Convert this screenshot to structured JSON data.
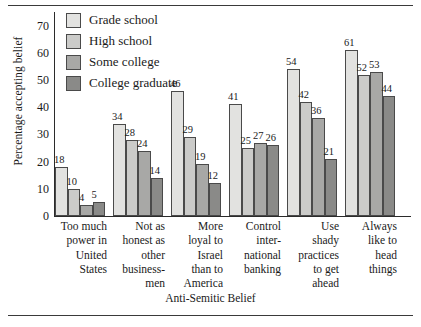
{
  "chart_data": {
    "type": "bar",
    "title": "",
    "xlabel": "Anti-Semitic Belief",
    "ylabel": "Percentage accepting belief",
    "ylim": [
      0,
      75
    ],
    "yticks": [
      0,
      10,
      20,
      30,
      40,
      50,
      60,
      70
    ],
    "grid": false,
    "legend_position": "top-left",
    "categories": [
      "Too much power in United States",
      "Not as honest as other business-men",
      "More loyal to Israel than to America",
      "Control inter-national banking",
      "Use shady practices to get ahead",
      "Always like to head things"
    ],
    "category_lines": [
      [
        "Too much",
        "power in",
        "United",
        "States"
      ],
      [
        "Not as",
        "honest as",
        "other",
        "business-",
        "men"
      ],
      [
        "More",
        "loyal to",
        "Israel",
        "than to",
        "America"
      ],
      [
        "Control",
        "inter-",
        "national",
        "banking"
      ],
      [
        "Use",
        "shady",
        "practices",
        "to get",
        "ahead"
      ],
      [
        "Always",
        "like to",
        "head",
        "things"
      ]
    ],
    "series": [
      {
        "name": "Grade school",
        "color": "#e2e2e0",
        "values": [
          18,
          34,
          46,
          41,
          54,
          61
        ]
      },
      {
        "name": "High school",
        "color": "#cbcbc9",
        "values": [
          10,
          28,
          29,
          25,
          42,
          52
        ]
      },
      {
        "name": "Some college",
        "color": "#a8a8a6",
        "values": [
          4,
          24,
          19,
          27,
          36,
          53
        ]
      },
      {
        "name": "College graduate",
        "color": "#8a8a88",
        "values": [
          5,
          14,
          12,
          26,
          21,
          44
        ]
      }
    ]
  },
  "legend": {
    "items": [
      {
        "label": "Grade school"
      },
      {
        "label": "High school"
      },
      {
        "label": "Some college"
      },
      {
        "label": "College graduate"
      }
    ]
  }
}
